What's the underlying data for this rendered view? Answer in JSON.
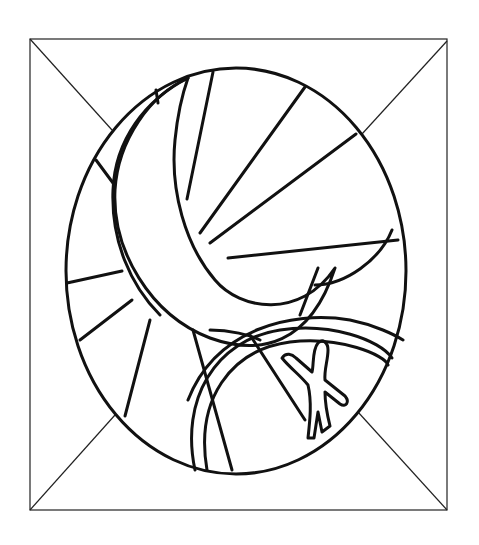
{
  "colors": {
    "background": "#ffffff",
    "line": "#111111",
    "frame_line": "#222222"
  },
  "frame": {
    "x1": 30,
    "y1": 39,
    "x2": 447,
    "y2": 510,
    "diagonals": [
      {
        "x1": 30,
        "y1": 39,
        "x2": 112,
        "y2": 130
      },
      {
        "x1": 447,
        "y1": 41,
        "x2": 362,
        "y2": 134
      },
      {
        "x1": 30,
        "y1": 510,
        "x2": 115,
        "y2": 415
      },
      {
        "x1": 447,
        "y1": 510,
        "x2": 358,
        "y2": 412
      }
    ]
  },
  "oval": {
    "cx": 236,
    "cy": 271,
    "rx": 170,
    "ry": 203
  },
  "paths": {
    "crescent": "M 188 78 C 150 95 118 140 115 190 C 112 250 150 315 210 338 C 260 356 310 345 335 268 C 300 320 240 310 215 280 C 185 245 170 190 175 140 C 178 110 183 92 188 78 Z",
    "ring_inner_left": "M 188 78 C 145 100 115 140 113 190 C 111 240 130 285 160 315",
    "ring_segments": [
      "M 156 90 L 158 103",
      "M 96 160 L 113 183",
      "M 67 283 L 122 271",
      "M 80 340 L 132 300",
      "M 125 416 L 150 320"
    ],
    "rays": [
      "M 213 72 L 187 199",
      "M 305 87 L 200 233",
      "M 356 134 L 210 243",
      "M 398 240 L 228 258",
      "M 392 230 C 380 260 345 285 315 285",
      "M 318 268 L 300 315"
    ],
    "lower_arcs": [
      "M 188 400 C 215 330 290 310 350 320 C 375 325 395 335 403 340",
      "M 195 470 C 180 400 215 340 280 330 C 330 322 380 340 392 358",
      "M 207 470 C 195 400 230 350 290 342 C 340 336 385 355 388 365",
      "M 210 330 C 230 330 250 335 260 340",
      "M 193 330 L 232 470",
      "M 250 335 L 305 420"
    ],
    "figure": "M 282 358 C 286 352 292 354 296 358 L 312 372 C 314 365 312 350 318 343 C 323 338 328 343 328 350 C 328 360 324 370 325 380 L 345 396 C 350 402 346 408 340 404 L 325 392 C 325 405 328 418 330 426 L 322 432 L 318 412 L 314 438 L 308 438 C 310 420 312 402 308 385 C 300 375 290 368 282 358 Z"
  },
  "labels": {
    "description": "Line-art drawing: a crescent moon with radiating rays inside an oval, a small human figure at lower right, framed by a square with corner diagonals."
  }
}
